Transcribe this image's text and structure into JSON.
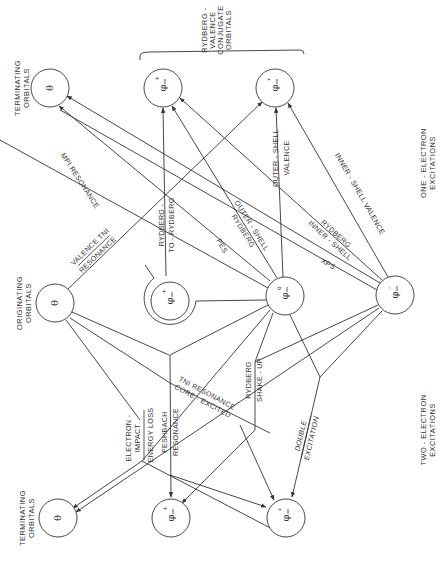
{
  "headers": {
    "terminating_top": [
      "TERMINATING",
      "ORBITALS"
    ],
    "originating": [
      "ORIGINATING",
      "ORBITALS"
    ],
    "terminating_bottom": [
      "TERMINATING",
      "ORBITALS"
    ],
    "rydberg_valence": [
      "RYDBERG -",
      "VALENCE",
      "CONJUGATE",
      "ORBITALS"
    ],
    "one_electron": [
      "ONE - ELECTRON",
      "EXCITATIONS"
    ],
    "two_electron": [
      "TWO - ELECTRON",
      "EXCITATIONS"
    ]
  },
  "nodes": {
    "term_top_theta": {
      "symbol": "θ"
    },
    "term_top_rydberg": {
      "symbol": "φ",
      "sup": "+",
      "bar": true
    },
    "term_top_valence": {
      "symbol": "φ",
      "sup": "*",
      "bar": true
    },
    "orig_theta": {
      "symbol": "θ"
    },
    "orig_rydberg": {
      "symbol": "φ",
      "sup": "+",
      "bar": true
    },
    "orig_phi0": {
      "symbol": "φ",
      "sup": "o",
      "bar": true
    },
    "orig_phi_minus": {
      "symbol": "φ",
      "sup": "-",
      "bar": true
    },
    "term_bot_theta": {
      "symbol": "θ"
    },
    "term_bot_rydberg": {
      "symbol": "φ",
      "sup": "+",
      "bar": true
    },
    "term_bot_valence": {
      "symbol": "φ",
      "sup": "*",
      "bar": true
    }
  },
  "edge_labels": {
    "mpi_resonance": "MPI RESONANCE",
    "valence_tni": "VALENCE TNI",
    "valence_tni_2": "RESONANCE",
    "rydberg_to_rydberg_1": "RYDBERG -",
    "rydberg_to_rydberg_2": "TO - RYDBERG",
    "pes": "PES",
    "outer_shell_rydberg_1": "OUTER - SHELL",
    "outer_shell_rydberg_2": "RYDBERG",
    "outer_shell_valence_1": "OUTER - SHELL",
    "outer_shell_valence_2": "VALENCE",
    "xps": "XPS",
    "inner_shell_rydberg_1": "INNER - SHELL",
    "inner_shell_rydberg_2": "RYDBERG",
    "inner_shell_valence": "INNER - SHELL  VALENCE",
    "electron_impact_1": "ELECTRON -",
    "electron_impact_2": "IMPACT",
    "energy_loss": "ENERGY  LOSS",
    "feshbach_1": "FESHBACH",
    "feshbach_2": "RESONANCE",
    "core_excited_1": "TNI RESONANCE",
    "core_excited_2": "CORE - EXCITED",
    "rydberg_shakeup_1": "RYDBERG",
    "rydberg_shakeup_2": "SHAKE - UP",
    "double_excitation_1": "DOUBLE",
    "double_excitation_2": "EXCITATION"
  },
  "colors": {
    "ink": "#333333",
    "paper": "#ffffff"
  }
}
